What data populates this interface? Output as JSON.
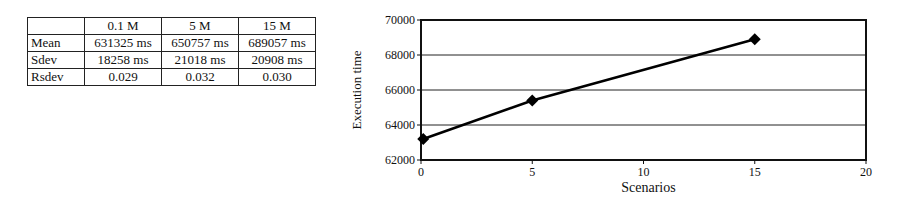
{
  "table": {
    "headers": [
      "",
      "0.1 M",
      "5 M",
      "15 M"
    ],
    "rows": [
      {
        "label": "Mean",
        "values": [
          "631325 ms",
          "650757 ms",
          "689057 ms"
        ]
      },
      {
        "label": "Sdev",
        "values": [
          "18258 ms",
          "21018 ms",
          "20908 ms"
        ]
      },
      {
        "label": "Rsdev",
        "values": [
          "0.029",
          "0.032",
          "0.030"
        ]
      }
    ]
  },
  "chart_data": {
    "type": "line",
    "title": "",
    "xlabel": "Scenarios",
    "ylabel": "Execution time",
    "x": [
      0.1,
      5,
      15
    ],
    "series": [
      {
        "name": "Execution time",
        "values": [
          63200,
          65400,
          68900
        ],
        "marker": "diamond",
        "color": "#000000"
      }
    ],
    "xlim": [
      0,
      20
    ],
    "ylim": [
      62000,
      70000
    ],
    "xticks": [
      "0",
      "5",
      "10",
      "15",
      "20"
    ],
    "yticks": [
      "62000",
      "64000",
      "66000",
      "68000",
      "70000"
    ],
    "grid": "horizontal",
    "legend": "none"
  }
}
